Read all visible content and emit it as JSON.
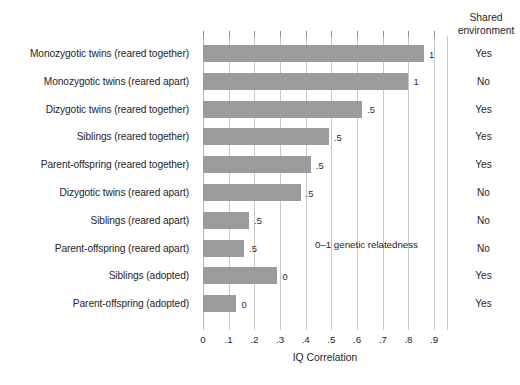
{
  "chart_data": {
    "type": "bar",
    "orientation": "horizontal",
    "title": "",
    "xlabel": "IQ Correlation",
    "ylabel": "",
    "xlim": [
      0,
      0.95
    ],
    "xticks": [
      0,
      0.1,
      0.2,
      0.3,
      0.4,
      0.5,
      0.6,
      0.7,
      0.8,
      0.9
    ],
    "xtick_labels": [
      "0",
      ".1",
      ".2",
      ".3",
      ".4",
      ".5",
      ".6",
      ".7",
      ".8",
      ".9"
    ],
    "grid": true,
    "legend": "none",
    "bar_color": "#9c9c9c",
    "annotation": "0–1 genetic relatedness",
    "categories": [
      "Monozygotic twins (reared together)",
      "Monozygotic twins (reared apart)",
      "Dizygotic twins (reared together)",
      "Siblings (reared together)",
      "Parent-offspring (reared together)",
      "Dizygotic twins (reared apart)",
      "Siblings (reared apart)",
      "Parent-offspring (reared apart)",
      "Siblings (adopted)",
      "Parent-offspring (adopted)"
    ],
    "values": [
      0.86,
      0.8,
      0.62,
      0.49,
      0.42,
      0.38,
      0.18,
      0.16,
      0.29,
      0.13
    ],
    "point_labels": [
      "1",
      "1",
      ".5",
      ".5",
      ".5",
      ".5",
      ".5",
      ".5",
      "0",
      "0"
    ],
    "extra_column": {
      "header_line1": "Shared",
      "header_line2": "environment",
      "values": [
        "Yes",
        "No",
        "Yes",
        "Yes",
        "Yes",
        "No",
        "No",
        "No",
        "Yes",
        "Yes"
      ]
    }
  }
}
